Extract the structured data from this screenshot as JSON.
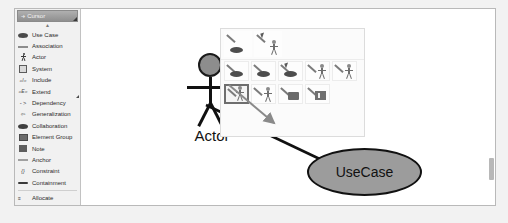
{
  "palette": {
    "header": {
      "label": "Cursor",
      "icon": "cursor-icon"
    },
    "scroll_up": "▲",
    "items": [
      {
        "label": "Use Case",
        "icon": "use-case-icon"
      },
      {
        "label": "Association",
        "icon": "association-icon"
      },
      {
        "label": "Actor",
        "icon": "actor-icon"
      },
      {
        "label": "System",
        "icon": "system-icon"
      },
      {
        "label": "Include",
        "icon": "include-icon",
        "glyph": "«I»"
      },
      {
        "label": "Extend",
        "icon": "extend-icon",
        "glyph": "«E»"
      },
      {
        "label": "Dependency",
        "icon": "dependency-icon",
        "glyph": "- >"
      },
      {
        "label": "Generalization",
        "icon": "generalization-icon",
        "glyph": "⇦"
      },
      {
        "label": "Collaboration",
        "icon": "collaboration-icon"
      },
      {
        "label": "Element Group",
        "icon": "element-group-icon"
      },
      {
        "label": "Note",
        "icon": "note-icon"
      },
      {
        "label": "Anchor",
        "icon": "anchor-icon"
      },
      {
        "label": "Constraint",
        "icon": "constraint-icon",
        "glyph": "{}"
      },
      {
        "label": "Containment",
        "icon": "containment-icon"
      },
      {
        "label": "Allocate",
        "icon": "allocate-icon",
        "glyph": "≡"
      }
    ]
  },
  "canvas": {
    "actor": {
      "name": "Actor"
    },
    "usecase": {
      "name": "UseCase"
    },
    "icon_popup": {
      "rows": [
        [
          {
            "icon": "create-use-case-icon",
            "selected": false
          },
          {
            "icon": "create-actor-icon",
            "selected": false
          }
        ],
        [
          {
            "icon": "use-case-association-icon",
            "selected": false
          },
          {
            "icon": "use-case-include-icon",
            "selected": false
          },
          {
            "icon": "use-case-extend-icon",
            "selected": false
          },
          {
            "icon": "actor-association-icon",
            "selected": false
          },
          {
            "icon": "actor-generalization-icon",
            "selected": false
          }
        ],
        [
          {
            "icon": "association-to-use-case-icon",
            "selected": true
          },
          {
            "icon": "association-to-actor-icon",
            "selected": false
          },
          {
            "icon": "association-to-system-icon",
            "selected": false
          },
          {
            "icon": "association-to-note-icon",
            "selected": false
          }
        ]
      ]
    }
  },
  "colors": {
    "actor_head_fill": "#8d8d8d",
    "usecase_fill": "#9c9c9c",
    "outline": "#111111",
    "drag_arrow": "#8a8a8a",
    "palette_header": "#8f8f8f",
    "canvas_bg": "#ffffff"
  }
}
